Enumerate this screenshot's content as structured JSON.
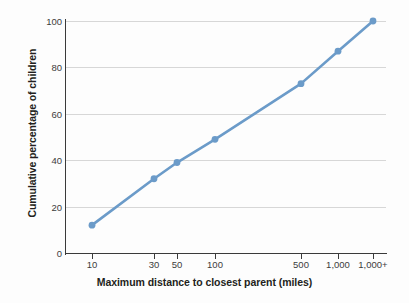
{
  "chart_data": {
    "type": "line",
    "title": "",
    "xlabel": "Maximum distance to closest parent (miles)",
    "ylabel": "Cumulative percentage of children",
    "categories": [
      "10",
      "30",
      "50",
      "100",
      "500",
      "1,000",
      "1,000+"
    ],
    "values": [
      12,
      32,
      39,
      49,
      73,
      87,
      100
    ],
    "x_positions": [
      10,
      30,
      50,
      100,
      500,
      1000,
      1001
    ],
    "series": [
      {
        "name": "Cumulative percentage of children",
        "values": [
          12,
          32,
          39,
          49,
          73,
          87,
          100
        ]
      }
    ],
    "ylim": [
      0,
      100
    ],
    "y_ticks": [
      0,
      20,
      40,
      60,
      80,
      100
    ],
    "y_tick_labels": [
      "0",
      "20",
      "40",
      "60",
      "80",
      "100"
    ],
    "x_tick_labels": [
      "10",
      "30",
      "50",
      "100",
      "500",
      "1,000",
      "1,000+"
    ],
    "grid": "horizontal",
    "legend": "none",
    "line_color": "#6b9bc9",
    "marker_color": "#6b9bc9",
    "gridline_color": "#d7d7d7",
    "axis_color": "#3a3a3a",
    "background_color": "#fdfdfd",
    "text_color": "#231f20"
  },
  "axes": {
    "y": {
      "title": "Cumulative percentage of children",
      "ticks": [
        {
          "label": "100",
          "value": 100
        },
        {
          "label": "80",
          "value": 80
        },
        {
          "label": "60",
          "value": 60
        },
        {
          "label": "40",
          "value": 40
        },
        {
          "label": "20",
          "value": 20
        },
        {
          "label": "0",
          "value": 0
        }
      ]
    },
    "x": {
      "title": "Maximum distance to closest parent (miles)",
      "ticks": [
        {
          "label": "10",
          "px": 92
        },
        {
          "label": "30",
          "px": 154
        },
        {
          "label": "50",
          "px": 177
        },
        {
          "label": "100",
          "px": 215
        },
        {
          "label": "500",
          "px": 301
        },
        {
          "label": "1,000",
          "px": 338
        },
        {
          "label": "1,000+",
          "px": 373
        }
      ]
    }
  },
  "points": [
    {
      "x_label": "10",
      "y": 12,
      "px": 92,
      "py": 225
    },
    {
      "x_label": "30",
      "y": 32,
      "px": 154,
      "py": 179
    },
    {
      "x_label": "50",
      "y": 39,
      "px": 177,
      "py": 163
    },
    {
      "x_label": "100",
      "y": 49,
      "px": 215,
      "py": 139
    },
    {
      "x_label": "500",
      "y": 73,
      "px": 301,
      "py": 84
    },
    {
      "x_label": "1,000",
      "y": 87,
      "px": 338,
      "py": 51
    },
    {
      "x_label": "1,000+",
      "y": 100,
      "px": 373,
      "py": 21
    }
  ]
}
